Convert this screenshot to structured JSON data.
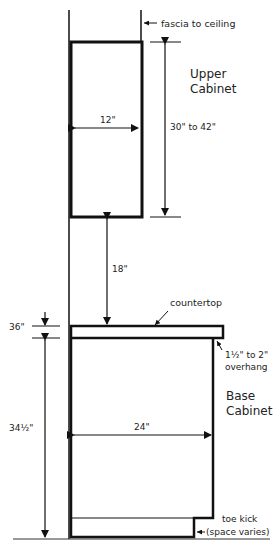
{
  "diagram": {
    "labels": {
      "fascia": "fascia to ceiling",
      "upper_title_1": "Upper",
      "upper_title_2": "Cabinet",
      "upper_width": "12\"",
      "upper_height": "30\" to 42\"",
      "gap": "18\"",
      "countertop": "countertop",
      "counter_height": "36\"",
      "overhang_1": "1½\" to 2\"",
      "overhang_2": "overhang",
      "base_title_1": "Base",
      "base_title_2": "Cabinet",
      "base_width": "24\"",
      "base_height": "34½\"",
      "toe_kick_1": "toe kick",
      "toe_kick_2": "(space varies)"
    },
    "colors": {
      "line": "#111111",
      "background": "#ffffff"
    }
  }
}
